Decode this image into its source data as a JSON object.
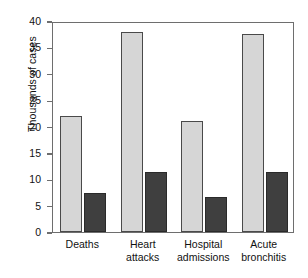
{
  "chart_data": {
    "type": "bar",
    "title": "",
    "xlabel": "",
    "ylabel": "Thousands of cases",
    "ylim": [
      0,
      40
    ],
    "yticks": [
      0,
      5,
      10,
      15,
      20,
      25,
      30,
      35,
      40
    ],
    "ytick_labels": [
      "0",
      "5",
      "10",
      "15",
      "20",
      "25",
      "30",
      "35",
      "40"
    ],
    "grid": false,
    "legend": "none",
    "categories": [
      "Deaths",
      "Heart attacks",
      "Hospital admissions",
      "Acute bronchitis"
    ],
    "category_lines": [
      [
        "Deaths",
        ""
      ],
      [
        "Heart",
        "attacks"
      ],
      [
        "Hospital",
        "admissions"
      ],
      [
        "Acute",
        "bronchitis"
      ]
    ],
    "series": [
      {
        "name": "light-series",
        "color": "#d6d6d6",
        "values": [
          22,
          38,
          21,
          37.5
        ]
      },
      {
        "name": "dark-series",
        "color": "#3f3f3f",
        "values": [
          7.4,
          11.4,
          6.6,
          11.4
        ]
      }
    ]
  },
  "colors": {
    "light_bar": "#d6d6d6",
    "dark_bar": "#3f3f3f",
    "axis": "#6e6e6e",
    "text": "#111111",
    "background": "#ffffff"
  }
}
